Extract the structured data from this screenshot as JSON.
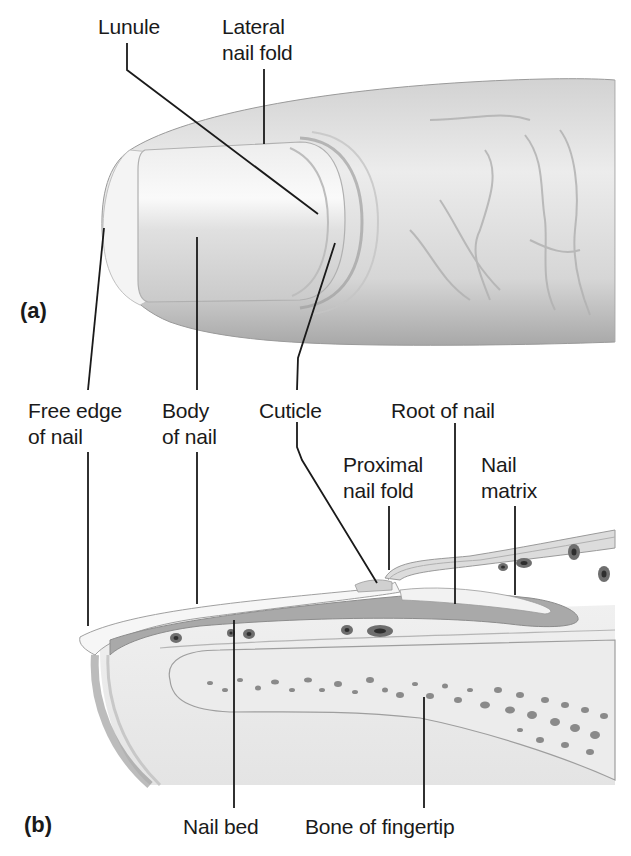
{
  "figure": {
    "panels": {
      "a": {
        "label": "(a)",
        "view": "finger-exterior"
      },
      "b": {
        "label": "(b)",
        "view": "sagittal-section"
      }
    },
    "labels_a": {
      "lunule": "Lunule",
      "lateral_nail_fold_1": "Lateral",
      "lateral_nail_fold_2": "nail fold"
    },
    "labels_shared": {
      "free_edge_1": "Free edge",
      "free_edge_2": "of nail",
      "body_1": "Body",
      "body_2": "of nail",
      "cuticle": "Cuticle"
    },
    "labels_b": {
      "root_of_nail": "Root of nail",
      "proximal_nail_fold_1": "Proximal",
      "proximal_nail_fold_2": "nail fold",
      "nail_matrix_1": "Nail",
      "nail_matrix_2": "matrix",
      "nail_bed": "Nail bed",
      "bone_of_fingertip": "Bone of fingertip"
    },
    "colors": {
      "skin_light": "#e9e9e9",
      "skin_mid": "#cfcfcf",
      "skin_dark": "#a9a9a9",
      "nail_plate": "#9a9a9a",
      "leader_line": "#1a1a1a",
      "bone_spots": "#7a7a7a"
    }
  }
}
